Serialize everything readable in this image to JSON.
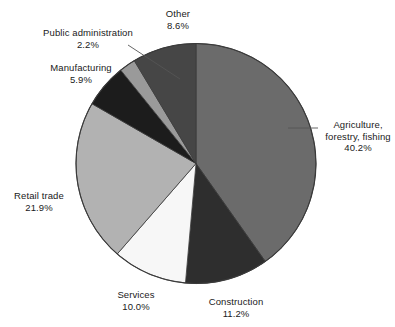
{
  "chart_data": {
    "type": "pie",
    "title": "",
    "subtitle": "",
    "xlabel": "",
    "ylabel": "",
    "legend_position": "labels-outside-with-leader-lines",
    "grid": false,
    "start_angle_deg": 0,
    "direction": "clockwise",
    "units": "percent",
    "categories": [
      "Agriculture, forestry, fishing",
      "Construction",
      "Services",
      "Retail trade",
      "Manufacturing",
      "Public administration",
      "Other"
    ],
    "values": [
      40.2,
      11.2,
      10.0,
      21.9,
      5.9,
      2.2,
      8.6
    ],
    "value_labels": [
      "40.2%",
      "11.2%",
      "10.0%",
      "21.9%",
      "5.9%",
      "2.2%",
      "8.6%"
    ],
    "colors": [
      "#6b6b6b",
      "#2e2e2e",
      "#f7f7f7",
      "#b2b2b2",
      "#1c1c1c",
      "#9a9a9a",
      "#464646"
    ],
    "slices": [
      {
        "name": "Agriculture, forestry, fishing",
        "value": 40.2,
        "label": "40.2%",
        "color": "#6b6b6b"
      },
      {
        "name": "Construction",
        "value": 11.2,
        "label": "11.2%",
        "color": "#2e2e2e"
      },
      {
        "name": "Services",
        "value": 10.0,
        "label": "10.0%",
        "color": "#f7f7f7"
      },
      {
        "name": "Retail trade",
        "value": 21.9,
        "label": "21.9%",
        "color": "#b2b2b2"
      },
      {
        "name": "Manufacturing",
        "value": 5.9,
        "label": "5.9%",
        "color": "#1c1c1c"
      },
      {
        "name": "Public administration",
        "value": 2.2,
        "label": "2.2%",
        "color": "#9a9a9a"
      },
      {
        "name": "Other",
        "value": 8.6,
        "label": "8.6%",
        "color": "#464646"
      }
    ]
  },
  "labels": {
    "agriculture": {
      "line1": "Agriculture,",
      "line2": "forestry, fishing",
      "value": "40.2%"
    },
    "construction": {
      "line1": "Construction",
      "value": "11.2%"
    },
    "services": {
      "line1": "Services",
      "value": "10.0%"
    },
    "retail_trade": {
      "line1": "Retail trade",
      "value": "21.9%"
    },
    "manufacturing": {
      "line1": "Manufacturing",
      "value": "5.9%"
    },
    "public_admin": {
      "line1": "Public administration",
      "value": "2.2%"
    },
    "other": {
      "line1": "Other",
      "value": "8.6%"
    }
  },
  "style": {
    "background": "#ffffff",
    "outline": "#3a3a3a",
    "text_color": "#1a1a1a",
    "leader_line": "#555555"
  }
}
